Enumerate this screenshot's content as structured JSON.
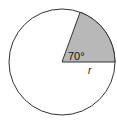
{
  "diagram": {
    "angle_label": "70°",
    "radius_label": "r",
    "angle_degrees": 70,
    "sector_fill": "#b8b8b8",
    "stroke_color": "#333333"
  }
}
